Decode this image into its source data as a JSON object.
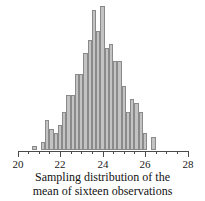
{
  "chart_data": {
    "type": "bar",
    "title": "",
    "caption_line1": "Sampling distribution of the",
    "caption_line2": "mean of sixteen observations",
    "xlabel": "",
    "ylabel": "",
    "xlim": [
      20,
      28
    ],
    "ylim": [
      0,
      34
    ],
    "grid": false,
    "legend": null,
    "bar_fill_color": "#c3c3c3",
    "bar_edge_color": "#8a8a8a",
    "axis_color": "#4a4a4a",
    "bin_width": 0.2,
    "major_ticks": [
      20,
      22,
      24,
      26,
      28
    ],
    "minor_ticks": [
      20.5,
      21,
      21.5,
      22.5,
      23,
      23.5,
      24.5,
      25,
      25.5,
      26.5,
      27,
      27.5
    ],
    "tick_labels": [
      "20",
      "22",
      "24",
      "26",
      "28"
    ],
    "x": [
      20.8,
      21.2,
      21.4,
      21.6,
      21.8,
      22.0,
      22.2,
      22.4,
      22.6,
      22.8,
      23.0,
      23.2,
      23.4,
      23.6,
      23.8,
      24.0,
      24.2,
      24.4,
      24.6,
      24.8,
      25.0,
      25.2,
      25.4,
      25.6,
      25.8,
      26.0,
      26.4
    ],
    "values": [
      1,
      2,
      7,
      5,
      4,
      6,
      9,
      13,
      13,
      18,
      18,
      23,
      26,
      33,
      28,
      34,
      24,
      25,
      21,
      21,
      15,
      9,
      12,
      11,
      9,
      4,
      3
    ]
  }
}
